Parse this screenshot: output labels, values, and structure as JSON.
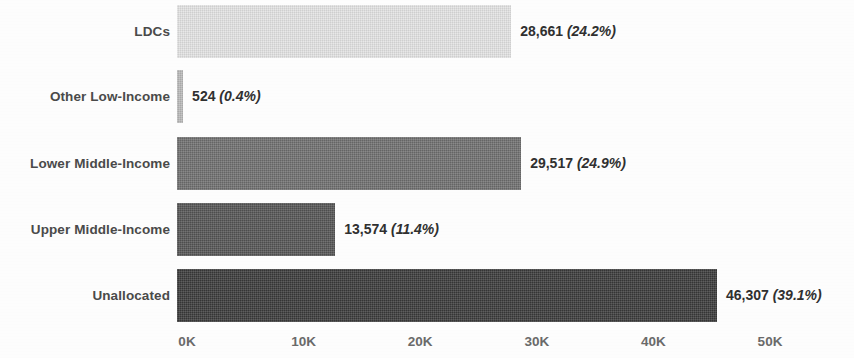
{
  "chart_data": {
    "type": "bar",
    "orientation": "horizontal",
    "title": "",
    "xlabel": "",
    "ylabel": "",
    "xlim": [
      0,
      50000
    ],
    "grid": false,
    "legend": false,
    "categories": [
      "LDCs",
      "Other Low-Income",
      "Lower Middle-Income",
      "Upper Middle-Income",
      "Unallocated"
    ],
    "values": [
      28661,
      29517,
      13574,
      46307,
      524
    ],
    "x_tick_labels": [
      "0K",
      "10K",
      "20K",
      "30K",
      "40K",
      "50K"
    ],
    "x_tick_values": [
      0,
      10000,
      20000,
      30000,
      40000,
      50000
    ],
    "bars": [
      {
        "category": "LDCs",
        "value": 28661,
        "value_text": "28,661",
        "percent": 24.2,
        "percent_text": "(24.2%)",
        "color": "#e3e3e3"
      },
      {
        "category": "Other Low-Income",
        "value": 524,
        "value_text": "524",
        "percent": 0.4,
        "percent_text": "(0.4%)",
        "color": "#b9b9b9"
      },
      {
        "category": "Lower Middle-Income",
        "value": 29517,
        "value_text": "29,517",
        "percent": 24.9,
        "percent_text": "(24.9%)",
        "color": "#6f6f6f"
      },
      {
        "category": "Upper Middle-Income",
        "value": 13574,
        "value_text": "13,574",
        "percent": 11.4,
        "percent_text": "(11.4%)",
        "color": "#545454"
      },
      {
        "category": "Unallocated",
        "value": 46307,
        "value_text": "46,307",
        "percent": 39.1,
        "percent_text": "(39.1%)",
        "color": "#3a3a3a"
      }
    ]
  }
}
